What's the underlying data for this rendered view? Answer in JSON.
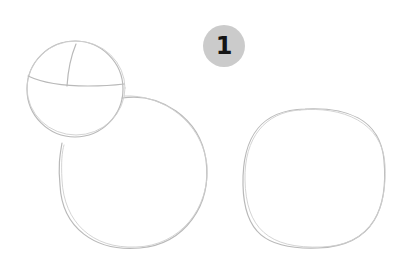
{
  "step": {
    "number": "1",
    "badge_color": "#cbcbcb",
    "text_color": "#141414"
  },
  "sketch": {
    "stroke_color": "#b9b9b9",
    "shapes": [
      {
        "name": "head-circle",
        "cx": 75,
        "cy": 87,
        "r": 48
      },
      {
        "name": "body-circle",
        "cx": 133,
        "cy": 172,
        "rx": 74,
        "ry": 76
      },
      {
        "name": "right-circle",
        "cx": 314,
        "cy": 178,
        "rx": 73,
        "ry": 70
      }
    ]
  }
}
